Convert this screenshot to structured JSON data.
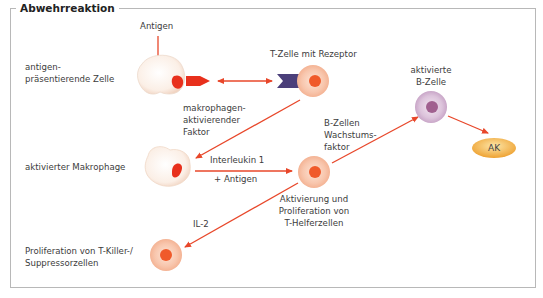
{
  "title": "Abwehrreaktion",
  "labels": {
    "antigen": "Antigen",
    "apc_line1": "antigen-",
    "apc_line2": "präsentierende Zelle",
    "tcell_receptor": "T-Zelle mit Rezeptor",
    "maf_line1": "makrophagen-",
    "maf_line2": "aktivierender",
    "maf_line3": "Faktor",
    "activated_macrophage": "aktivierter Makrophage",
    "interleukin1": "Interleukin 1",
    "plus_antigen": "+ Antigen",
    "bcgf_line1": "B-Zellen",
    "bcgf_line2": "Wachstums-",
    "bcgf_line3": "faktor",
    "activated_bcell_line1": "aktivierte",
    "activated_bcell_line2": "B-Zelle",
    "ak": "AK",
    "th_line1": "Aktivierung und",
    "th_line2": "Proliferation von",
    "th_line3": "T-Helferzellen",
    "il2": "IL-2",
    "tkiller_line1": "Proliferation von T-Killer-/",
    "tkiller_line2": "Suppressorzellen"
  },
  "colors": {
    "arrow": "#e8472a",
    "receptor": "#4b3f7a",
    "antigen_fragment": "#e8301c",
    "tcell_outer": "#f7c2a8",
    "tcell_nucleus": "#f05a2a",
    "bcell_outer": "#d9bfd9",
    "bcell_nucleus": "#a0608f",
    "ak_fill": "#f2b040",
    "macrophage_fill": "#fbeee4"
  }
}
